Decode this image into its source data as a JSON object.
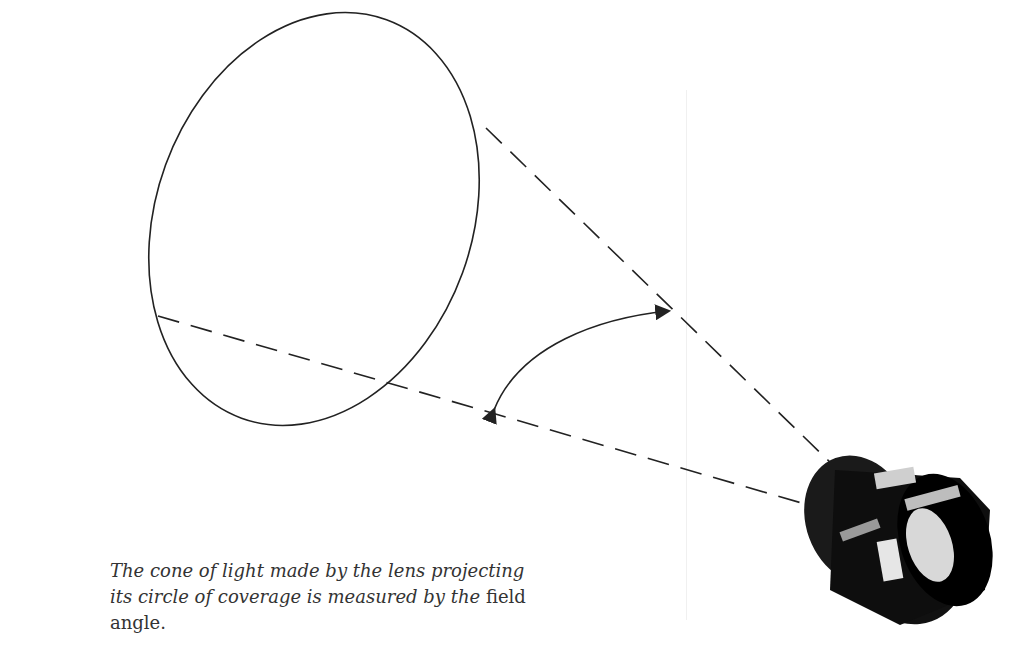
{
  "figure": {
    "elements": {
      "circle_of_coverage": "ellipse",
      "cone_lines": "dashed lines from lens to ellipse",
      "field_angle_arrow": "double-headed curved arrow",
      "lens": "large-format camera lens"
    },
    "lens_markings": [
      "2004",
      "7801411"
    ]
  },
  "caption": {
    "italic_part": "The cone of light made by the lens projecting its circle of coverage is measured by the ",
    "roman_part": "field angle."
  }
}
